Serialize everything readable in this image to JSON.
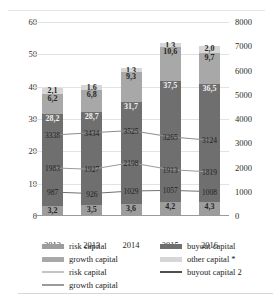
{
  "chart_data": {
    "type": "bar",
    "title": "",
    "subtitle": "",
    "xlabel": "",
    "ylabel": "",
    "categories": [
      "2012",
      "2013",
      "2014",
      "2015",
      "2016"
    ],
    "ylim": [
      0,
      60
    ],
    "yticks": [
      "0",
      "10",
      "20",
      "30",
      "40",
      "50",
      "60"
    ],
    "y2lim": [
      0,
      8000
    ],
    "y2ticks": [
      "0",
      "1000",
      "2000",
      "3000",
      "4000",
      "5000",
      "6000",
      "7000",
      "8000"
    ],
    "grid": true,
    "legend_position": "bottom",
    "stacked": true,
    "series": [
      {
        "name": "risk capital",
        "kind": "bar",
        "axis": "left",
        "color": "#9d9d9d",
        "values": [
          3.2,
          3.5,
          3.6,
          4.2,
          4.3
        ],
        "labels": [
          "3,2",
          "3,5",
          "3,6",
          "4,2",
          "4,3"
        ]
      },
      {
        "name": "buyout capital",
        "kind": "bar",
        "axis": "left",
        "color": "#6f6f6f",
        "values": [
          28.2,
          28.7,
          31.7,
          37.5,
          36.5
        ],
        "labels": [
          "28,2",
          "28,7",
          "31,7",
          "37,5",
          "36,5"
        ]
      },
      {
        "name": "growth capital",
        "kind": "bar",
        "axis": "left",
        "color": "#a8a8a8",
        "values": [
          6.2,
          6.8,
          9.3,
          10.6,
          9.7
        ],
        "labels": [
          "6,2",
          "6,8",
          "9,3",
          "10,6",
          "9,7"
        ]
      },
      {
        "name": "other capital *",
        "kind": "bar",
        "axis": "left",
        "color": "#d6d6d6",
        "values": [
          2.1,
          1.6,
          1.3,
          1.3,
          2.0
        ],
        "labels": [
          "2,1",
          "1,6",
          "1,3",
          "1,3",
          "2,0"
        ]
      },
      {
        "name": "buyout capital 2",
        "kind": "line",
        "axis": "right",
        "color": "#8c8c8c",
        "values": [
          3338,
          3434,
          3525,
          3265,
          3124
        ],
        "labels": [
          "3338",
          "3434",
          "3525",
          "3265",
          "3124"
        ]
      },
      {
        "name": "growth capital",
        "kind": "line",
        "axis": "right",
        "color": "#9a9a9a",
        "values": [
          1983,
          1927,
          2198,
          1913,
          1819
        ],
        "labels": [
          "1983",
          "1927",
          "2198",
          "1913",
          "1819"
        ]
      },
      {
        "name": "risk capital",
        "kind": "line",
        "axis": "right",
        "color": "#707070",
        "values": [
          987,
          926,
          1029,
          1057,
          1008
        ],
        "labels": [
          "987",
          "926",
          "1029",
          "1057",
          "1008"
        ]
      }
    ]
  },
  "legend": {
    "left_items": [
      {
        "label": "risk capital",
        "type": "bar",
        "color": "#9d9d9d"
      },
      {
        "label": "growth capital",
        "type": "bar",
        "color": "#a8a8a8"
      },
      {
        "label": "risk capital",
        "type": "line",
        "color": "#c4c4c4"
      },
      {
        "label": "growth capital",
        "type": "line",
        "color": "#9a9a9a"
      }
    ],
    "right_items": [
      {
        "label": "buyout capital",
        "type": "bar",
        "color": "#6f6f6f"
      },
      {
        "label": "other capital *",
        "type": "bar",
        "color": "#d6d6d6"
      },
      {
        "label": "buyout capital 2",
        "type": "line",
        "color": "#4f4f4f"
      }
    ]
  }
}
